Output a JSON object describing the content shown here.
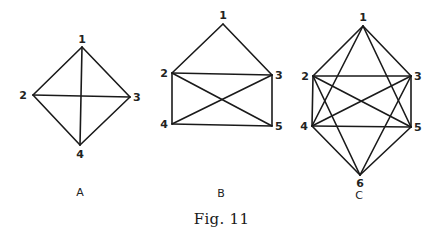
{
  "caption": "Fig. 11",
  "colors": {
    "ink": "#1a1a1a",
    "background": "#ffffff"
  },
  "graphs": [
    {
      "id": "A",
      "label": "A",
      "label_pos": [
        80,
        196
      ],
      "nodes": [
        {
          "id": "1",
          "x": 82,
          "y": 47,
          "lx": 82,
          "ly": 43,
          "anchor": "middle"
        },
        {
          "id": "2",
          "x": 33,
          "y": 95,
          "lx": 27,
          "ly": 99,
          "anchor": "end"
        },
        {
          "id": "3",
          "x": 130,
          "y": 97,
          "lx": 133,
          "ly": 101,
          "anchor": "start"
        },
        {
          "id": "4",
          "x": 80,
          "y": 145,
          "lx": 80,
          "ly": 158,
          "anchor": "middle"
        }
      ],
      "edges": [
        [
          "1",
          "2"
        ],
        [
          "1",
          "3"
        ],
        [
          "1",
          "4"
        ],
        [
          "2",
          "3"
        ],
        [
          "2",
          "4"
        ],
        [
          "3",
          "4"
        ]
      ]
    },
    {
      "id": "B",
      "label": "B",
      "label_pos": [
        221,
        197
      ],
      "nodes": [
        {
          "id": "1",
          "x": 223,
          "y": 24,
          "lx": 223,
          "ly": 19,
          "anchor": "middle"
        },
        {
          "id": "2",
          "x": 172,
          "y": 73,
          "lx": 168,
          "ly": 77,
          "anchor": "end"
        },
        {
          "id": "3",
          "x": 272,
          "y": 75,
          "lx": 275,
          "ly": 79,
          "anchor": "start"
        },
        {
          "id": "4",
          "x": 172,
          "y": 124,
          "lx": 168,
          "ly": 128,
          "anchor": "end"
        },
        {
          "id": "5",
          "x": 272,
          "y": 126,
          "lx": 275,
          "ly": 130,
          "anchor": "start"
        }
      ],
      "edges": [
        [
          "1",
          "2"
        ],
        [
          "1",
          "3"
        ],
        [
          "2",
          "3"
        ],
        [
          "2",
          "4"
        ],
        [
          "2",
          "5"
        ],
        [
          "3",
          "4"
        ],
        [
          "3",
          "5"
        ],
        [
          "4",
          "5"
        ]
      ]
    },
    {
      "id": "C",
      "label": "C",
      "label_pos": [
        359,
        199
      ],
      "nodes": [
        {
          "id": "1",
          "x": 363,
          "y": 26,
          "lx": 363,
          "ly": 21,
          "anchor": "middle"
        },
        {
          "id": "2",
          "x": 313,
          "y": 76,
          "lx": 309,
          "ly": 80,
          "anchor": "end"
        },
        {
          "id": "3",
          "x": 411,
          "y": 76,
          "lx": 414,
          "ly": 80,
          "anchor": "start"
        },
        {
          "id": "4",
          "x": 312,
          "y": 126,
          "lx": 308,
          "ly": 130,
          "anchor": "end"
        },
        {
          "id": "5",
          "x": 411,
          "y": 127,
          "lx": 414,
          "ly": 131,
          "anchor": "start"
        },
        {
          "id": "6",
          "x": 360,
          "y": 175,
          "lx": 360,
          "ly": 187,
          "anchor": "middle"
        }
      ],
      "edges": [
        [
          "1",
          "2"
        ],
        [
          "1",
          "3"
        ],
        [
          "1",
          "4"
        ],
        [
          "1",
          "5"
        ],
        [
          "2",
          "3"
        ],
        [
          "2",
          "4"
        ],
        [
          "2",
          "5"
        ],
        [
          "2",
          "6"
        ],
        [
          "3",
          "4"
        ],
        [
          "3",
          "5"
        ],
        [
          "3",
          "6"
        ],
        [
          "4",
          "5"
        ],
        [
          "4",
          "6"
        ],
        [
          "5",
          "6"
        ]
      ]
    }
  ]
}
